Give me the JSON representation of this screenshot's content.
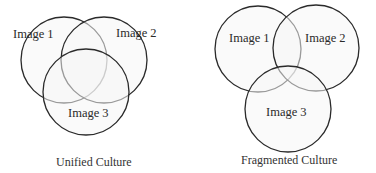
{
  "diagrams": [
    {
      "caption": "Unified Culture",
      "circles": [
        {
          "label": "Image 1"
        },
        {
          "label": "Image 2"
        },
        {
          "label": "Image 3"
        }
      ]
    },
    {
      "caption": "Fragmented Culture",
      "circles": [
        {
          "label": "Image 1"
        },
        {
          "label": "Image 2"
        },
        {
          "label": "Image 3"
        }
      ]
    }
  ],
  "colors": {
    "stroke": "#2a2a2a",
    "fill": "#f6f6f6",
    "text": "#2a2a2a"
  }
}
